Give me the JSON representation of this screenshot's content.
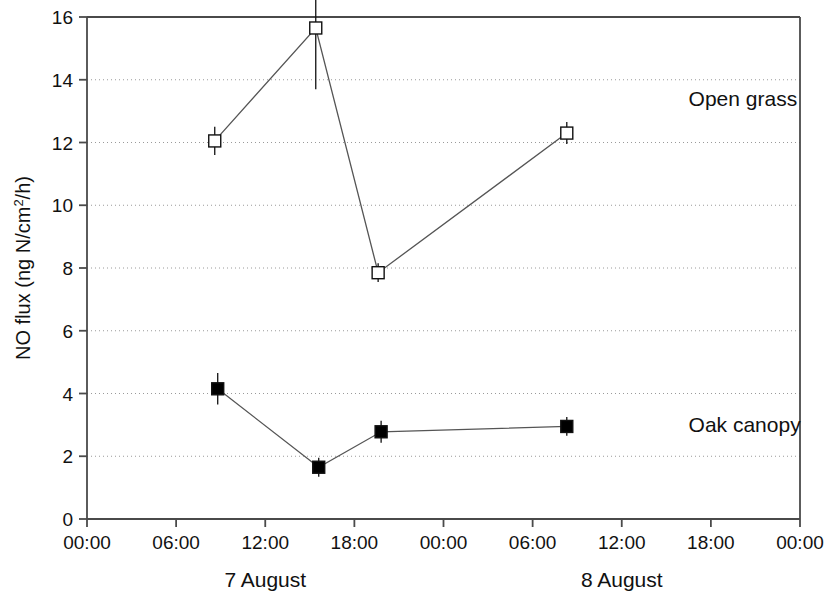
{
  "chart_data": {
    "type": "line",
    "title": "",
    "xlabel": "",
    "ylabel": "NO flux (ng N/cm2/h)",
    "ylabel_parts": {
      "pre": "NO flux (ng N/cm",
      "sup": "2",
      "post": "/h)"
    },
    "ylim": [
      0,
      16
    ],
    "yticks": [
      0,
      2,
      4,
      6,
      8,
      10,
      12,
      14,
      16
    ],
    "ytick_labels": [
      "0",
      "2",
      "4",
      "6",
      "8",
      "10",
      "12",
      "14",
      "16"
    ],
    "xlim_hours": [
      0,
      48
    ],
    "xticks_hours": [
      0,
      6,
      12,
      18,
      24,
      30,
      36,
      42,
      48
    ],
    "xtick_labels": [
      "00:00",
      "06:00",
      "12:00",
      "18:00",
      "00:00",
      "06:00",
      "12:00",
      "18:00",
      "00:00"
    ],
    "day_labels": [
      {
        "text": "7 August",
        "hour": 12
      },
      {
        "text": "8 August",
        "hour": 36
      }
    ],
    "grid": {
      "horizontal": true,
      "vertical": false,
      "style": "dotted"
    },
    "legend": {
      "position": "inline-right",
      "type": "series-annotation"
    },
    "series": [
      {
        "name": "Open grass",
        "marker": "open-square",
        "label_hour": 40.5,
        "label_value": 13.4,
        "points": [
          {
            "hour": 8.6,
            "value": 12.05,
            "err": 0.45
          },
          {
            "hour": 15.4,
            "value": 15.65,
            "err": 1.95
          },
          {
            "hour": 19.6,
            "value": 7.85,
            "err": 0.3
          },
          {
            "hour": 32.3,
            "value": 12.3,
            "err": 0.35
          }
        ]
      },
      {
        "name": "Oak canopy",
        "marker": "filled-square",
        "label_hour": 40.5,
        "label_value": 3.0,
        "points": [
          {
            "hour": 8.8,
            "value": 4.15,
            "err": 0.5
          },
          {
            "hour": 15.6,
            "value": 1.65,
            "err": 0.3
          },
          {
            "hour": 19.8,
            "value": 2.78,
            "err": 0.35
          },
          {
            "hour": 32.3,
            "value": 2.95,
            "err": 0.3
          }
        ]
      }
    ],
    "colors": {
      "axis": "#4a4a4a",
      "grid": "#9a9a9a",
      "line": "#555555",
      "marker_fill_open": "#ffffff",
      "marker_fill_closed": "#000000",
      "marker_edge": "#111111",
      "text": "#111111",
      "background": "#ffffff"
    }
  }
}
